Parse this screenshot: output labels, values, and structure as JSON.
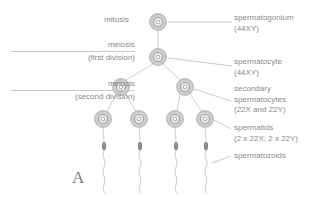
{
  "figure": {
    "panel_letter": "A",
    "colors": {
      "background": "#ffffff",
      "text": "#8a8a8a",
      "leader_line": "#c9c9c9",
      "cell_outer": "#b9b9b9",
      "cell_mid": "#e4e4e4",
      "cell_nucleus": "#9d9d9d",
      "sperm_head": "#8f8f8f",
      "sperm_tail": "#c2c2c2"
    }
  },
  "stage_labels": [
    {
      "id": "mitosis",
      "line1": "mitosis",
      "line2": "",
      "rule": false
    },
    {
      "id": "meiosis-first",
      "line1": "meiosis",
      "line2": "(first division)",
      "rule": true
    },
    {
      "id": "meiosis-second",
      "line1": "meiosis",
      "line2": "(second division)",
      "rule": true
    }
  ],
  "callouts": [
    {
      "id": "spermatogonium",
      "line1": "spermatogonium",
      "line2": "(44XY)",
      "line3": ""
    },
    {
      "id": "spermatocyte",
      "line1": "spermatocyte",
      "line2": "(44XY)",
      "line3": ""
    },
    {
      "id": "secondary-spermatocytes",
      "line1": "secondary",
      "line2": "spermatocytes",
      "line3": "(22X and 22Y)"
    },
    {
      "id": "spermatids",
      "line1": "spermatids",
      "line2": "(2 x 22X; 2 x 22Y)",
      "line3": ""
    },
    {
      "id": "spermatozoids",
      "line1": "spermatozoids",
      "line2": "",
      "line3": ""
    }
  ],
  "cells": {
    "spermatogonium": [
      {
        "x": 158,
        "y": 22,
        "r": 8.5
      }
    ],
    "spermatocyte": [
      {
        "x": 158,
        "y": 57,
        "r": 8.5
      }
    ],
    "secondary_spermatocytes": [
      {
        "x": 121,
        "y": 87,
        "r": 8.5
      },
      {
        "x": 185,
        "y": 87,
        "r": 8.5
      }
    ],
    "spermatids": [
      {
        "x": 103,
        "y": 119,
        "r": 8.5
      },
      {
        "x": 139,
        "y": 119,
        "r": 8.5
      },
      {
        "x": 175,
        "y": 119,
        "r": 8.5
      },
      {
        "x": 205,
        "y": 119,
        "r": 8.5
      }
    ],
    "spermatozoids": [
      {
        "x": 104,
        "y": 146
      },
      {
        "x": 140,
        "y": 146
      },
      {
        "x": 176,
        "y": 146
      },
      {
        "x": 206,
        "y": 146
      }
    ]
  }
}
